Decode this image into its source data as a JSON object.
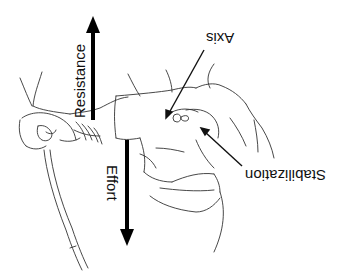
{
  "diagram": {
    "type": "biomechanics-illustration",
    "labels": {
      "resistance": "Resistance",
      "effort": "Effort",
      "axis": "Axis",
      "stabilization": "Stabilization"
    },
    "colors": {
      "line": "#333333",
      "arrow": "#000000",
      "background": "#ffffff"
    }
  }
}
